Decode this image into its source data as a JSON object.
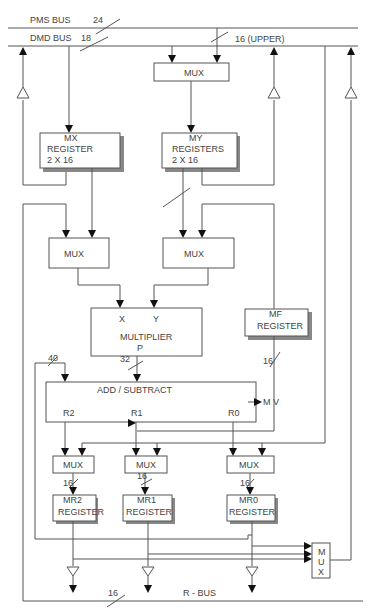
{
  "buses": {
    "pms": {
      "label": "PMS BUS",
      "width": "24"
    },
    "dmd": {
      "label": "DMD BUS",
      "width": "18"
    },
    "upper": {
      "label": "16 (UPPER)"
    },
    "r_bus": {
      "label": "R - BUS",
      "width": "16"
    }
  },
  "blocks": {
    "top_mux": {
      "label": "MUX"
    },
    "mx": {
      "line1": "MX",
      "line2": "REGISTER",
      "line3": "2 X 16"
    },
    "my": {
      "line1": "MY",
      "line2": "REGISTERS",
      "line3": "2 X 16"
    },
    "mux_x": {
      "label": "MUX"
    },
    "mux_y": {
      "label": "MUX"
    },
    "multiplier": {
      "in_x": "X",
      "in_y": "Y",
      "label": "MULTIPLIER",
      "out": "P"
    },
    "mf": {
      "line1": "MF",
      "line2": "REGISTER"
    },
    "add_sub": {
      "label": "ADD / SUBTRACT",
      "r2": "R2",
      "r1": "R1",
      "r0": "R0",
      "mv": "M V"
    },
    "mux_r2": {
      "label": "MUX"
    },
    "mux_r1": {
      "label": "MUX"
    },
    "mux_r0": {
      "label": "MUX"
    },
    "mr2": {
      "line1": "MR2",
      "line2": "REGISTER"
    },
    "mr1": {
      "line1": "MR1",
      "line2": "REGISTER"
    },
    "mr0": {
      "line1": "MR0",
      "line2": "REGISTER"
    },
    "out_mux": {
      "l1": "M",
      "l2": "U",
      "l3": "X"
    }
  },
  "bit_widths": {
    "p_out": "32",
    "feedback": "40",
    "mf_out": "16",
    "mr2_in": "16",
    "mr1_in": "16",
    "mr0_in": "16"
  }
}
